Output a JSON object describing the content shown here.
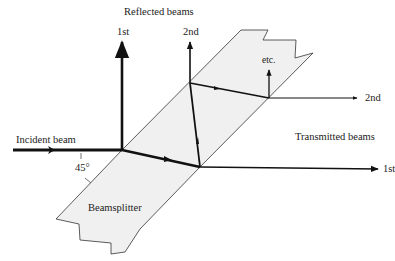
{
  "diagram": {
    "labels": {
      "reflected_beams": "Reflected beams",
      "reflected_1st": "1st",
      "reflected_2nd": "2nd",
      "etc": "etc.",
      "transmitted_2nd": "2nd",
      "transmitted_beams": "Transmitted beams",
      "incident_beam": "Incident beam",
      "angle": "45°",
      "transmitted_1st": "1st",
      "beamsplitter": "Beamsplitter"
    },
    "colors": {
      "splitter_fill": "#f0f0f0",
      "splitter_stroke": "#333333",
      "beam": "#111111",
      "text": "#222222"
    }
  }
}
